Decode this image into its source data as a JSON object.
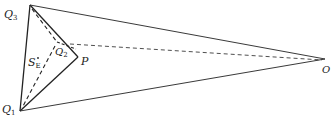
{
  "diagram": {
    "stroke_color": "#222222",
    "background": "#ffffff",
    "points": {
      "Q3": {
        "label": "Q",
        "sub": "3",
        "x": 30,
        "y": 5
      },
      "Q1": {
        "label": "Q",
        "sub": "1",
        "x": 20,
        "y": 111
      },
      "Q2": {
        "label": "Q",
        "sub": "2",
        "x": 57,
        "y": 42
      },
      "P": {
        "label": "P",
        "x": 78,
        "y": 57
      },
      "O": {
        "label": "O",
        "x": 325,
        "y": 59
      },
      "SE": {
        "label": "S",
        "sub": "E",
        "x": 37,
        "y": 62
      }
    },
    "labels": {
      "q3": "Q",
      "q3_sub": "3",
      "q1": "Q",
      "q1_sub": "1",
      "q2": "Q",
      "q2_sub": "2",
      "p": "P",
      "o": "O",
      "se": "S",
      "se_sub": "E"
    }
  }
}
